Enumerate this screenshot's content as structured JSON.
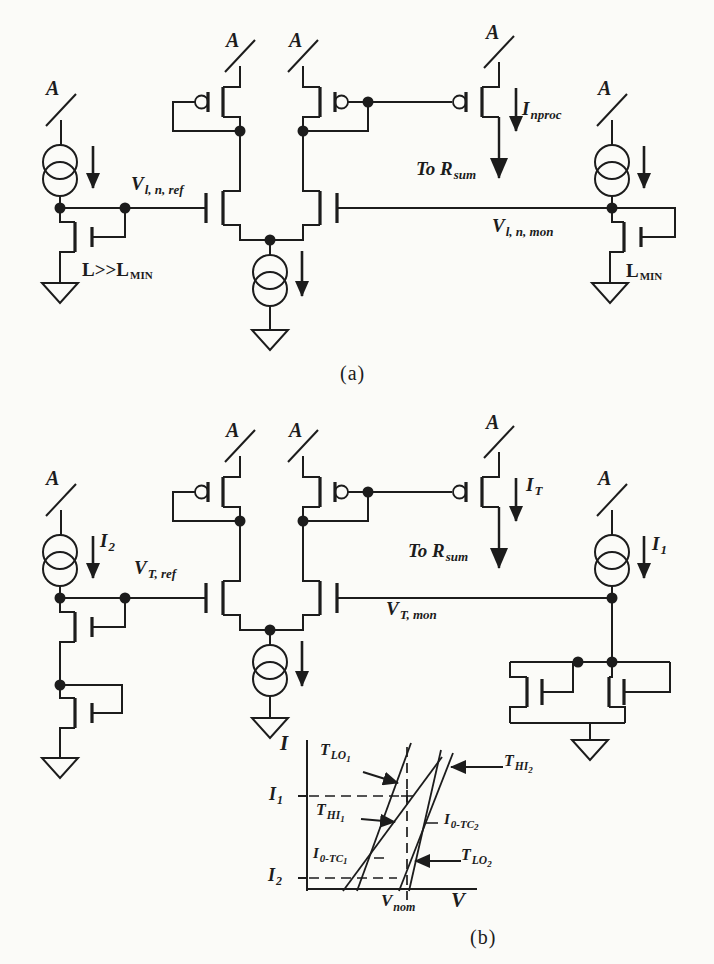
{
  "colors": {
    "ink": "#1c1c1c",
    "paper": "#fbfbf8"
  },
  "figure": {
    "caption_a": "(a)",
    "caption_b": "(b)"
  },
  "circuit_a": {
    "supply_label": "A",
    "labels": {
      "vref": {
        "main": "V",
        "sub": "l, n, ref"
      },
      "vmon": {
        "main": "V",
        "sub": "l, n, mon"
      },
      "iout": {
        "main": "I",
        "sub": "nproc"
      },
      "to_rsum": {
        "main": "To R",
        "sub": "sum"
      },
      "l_ref": {
        "main": "L>>L",
        "sub": "MIN"
      },
      "l_mon": {
        "main": "L",
        "sub": "MIN"
      }
    }
  },
  "circuit_b": {
    "supply_label": "A",
    "labels": {
      "i2": {
        "main": "I",
        "sub": "2"
      },
      "i1": {
        "main": "I",
        "sub": "1"
      },
      "iout": {
        "main": "I",
        "sub": "T"
      },
      "vref": {
        "main": "V",
        "sub": "T, ref"
      },
      "vmon": {
        "main": "V",
        "sub": "T, mon"
      },
      "to_rsum": {
        "main": "To R",
        "sub": "sum"
      }
    }
  },
  "graph": {
    "ylabel": "I",
    "xlabel": "V",
    "y_refs": [
      {
        "main": "I",
        "sub": "1"
      },
      {
        "main": "I",
        "sub": "2"
      }
    ],
    "x_ref": {
      "main": "V",
      "sub": "nom"
    },
    "curves": [
      {
        "main": "T",
        "sub": "LO",
        "sub2": "1"
      },
      {
        "main": "T",
        "sub": "HI",
        "sub2": "1"
      },
      {
        "main": "T",
        "sub": "HI",
        "sub2": "2"
      },
      {
        "main": "T",
        "sub": "LO",
        "sub2": "2"
      }
    ],
    "zero_tc_points": [
      {
        "main": "I",
        "sub": "0-TC",
        "sub2": "1"
      },
      {
        "main": "I",
        "sub": "0-TC",
        "sub2": "2"
      }
    ]
  }
}
